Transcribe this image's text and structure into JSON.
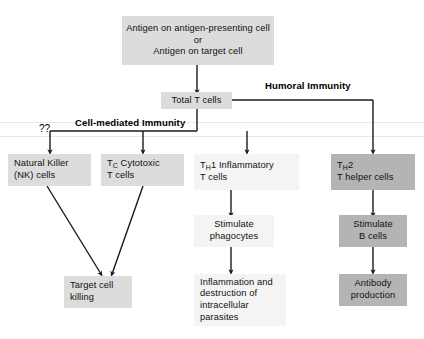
{
  "diagram": {
    "colors": {
      "box_light": "#dcdcdc",
      "box_dark": "#b4b4b4",
      "box_plain": "#f4f4f4",
      "line": "#1a1a1a",
      "text": "#111111",
      "background": "#ffffff"
    }
  },
  "nodes": {
    "antigen": {
      "line1": "Antigen on antigen-presenting cell",
      "line2": "or",
      "line3": "Antigen on target cell"
    },
    "total_t_cells": {
      "line1": "Total T cells"
    },
    "nk_cells": {
      "line1": "Natural Killer",
      "line2": "(NK) cells"
    },
    "tc_cytotoxic": {
      "line1_pre": "T",
      "line1_sub": "C",
      "line1_post": " Cytotoxic",
      "line2": "T cells"
    },
    "th1_inflammatory": {
      "line1_pre": "T",
      "line1_sub": "H",
      "line1_post": "1 Inflammatory",
      "line2": "T cells"
    },
    "th2_helper": {
      "line1_pre": "T",
      "line1_sub": "H",
      "line1_post": "2",
      "line2": "T helper cells"
    },
    "stimulate_phagocytes": {
      "line1": "Stimulate",
      "line2": "phagocytes"
    },
    "stimulate_b_cells": {
      "line1": "Stimulate",
      "line2": "B cells"
    },
    "target_cell_killing": {
      "line1": "Target cell",
      "line2": "killing"
    },
    "inflammation_destruction": {
      "line1": "Inflammation and",
      "line2": "destruction of",
      "line3": "intracellular",
      "line4": "parasites"
    },
    "antibody_production": {
      "line1": "Antibody",
      "line2": "production"
    }
  },
  "labels": {
    "humoral_immunity": "Humoral Immunity",
    "cell_mediated_immunity": "Cell-mediated Immunity",
    "unknown_marker": "??"
  }
}
